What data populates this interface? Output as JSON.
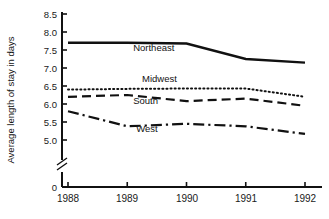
{
  "chart_data": {
    "type": "line",
    "title": "",
    "xlabel": "",
    "ylabel": "Average length of stay in days",
    "x": [
      1988,
      1989,
      1990,
      1991,
      1992
    ],
    "categories": [
      "1988",
      "1989",
      "1990",
      "1991",
      "1992"
    ],
    "ylim": [
      5.0,
      8.5
    ],
    "yticks": [
      8.5,
      8.0,
      7.5,
      7.0,
      6.5,
      6.0,
      5.5,
      5.0
    ],
    "ytick_labels": [
      "8.5",
      "8.0",
      "7.5",
      "7.0",
      "6.5",
      "6.0",
      "5.5",
      "5.0"
    ],
    "zero_tick_label": "0",
    "axis_break": true,
    "grid": false,
    "legend_position": "inline-labels",
    "series": [
      {
        "name": "Northeast",
        "values": [
          7.7,
          7.7,
          7.68,
          7.25,
          7.15
        ],
        "line_style": "solid",
        "color": "#111111",
        "width": 2.4,
        "label_x": 1989.1,
        "label_y": 7.47
      },
      {
        "name": "Midwest",
        "values": [
          6.4,
          6.42,
          6.43,
          6.43,
          6.2
        ],
        "line_style": "dotted",
        "color": "#111111",
        "width": 2.0,
        "label_x": 1989.25,
        "label_y": 6.62
      },
      {
        "name": "South",
        "values": [
          6.2,
          6.25,
          6.08,
          6.15,
          5.95
        ],
        "line_style": "dashed",
        "color": "#111111",
        "width": 2.2,
        "label_x": 1989.1,
        "label_y": 5.99
      },
      {
        "name": "West",
        "values": [
          5.8,
          5.38,
          5.45,
          5.38,
          5.17
        ],
        "line_style": "dash-dot",
        "color": "#111111",
        "width": 2.2,
        "label_x": 1989.15,
        "label_y": 5.22
      }
    ]
  },
  "axis": {
    "y_title": "Average length of stay in days",
    "y_tick_0": "8.5",
    "y_tick_1": "8.0",
    "y_tick_2": "7.5",
    "y_tick_3": "7.0",
    "y_tick_4": "6.5",
    "y_tick_5": "6.0",
    "y_tick_6": "5.5",
    "y_tick_7": "5.0",
    "y_tick_zero": "0",
    "x_tick_0": "1988",
    "x_tick_1": "1989",
    "x_tick_2": "1990",
    "x_tick_3": "1991",
    "x_tick_4": "1992"
  },
  "labels": {
    "northeast": "Northeast",
    "midwest": "Midwest",
    "south": "South",
    "west": "West"
  }
}
